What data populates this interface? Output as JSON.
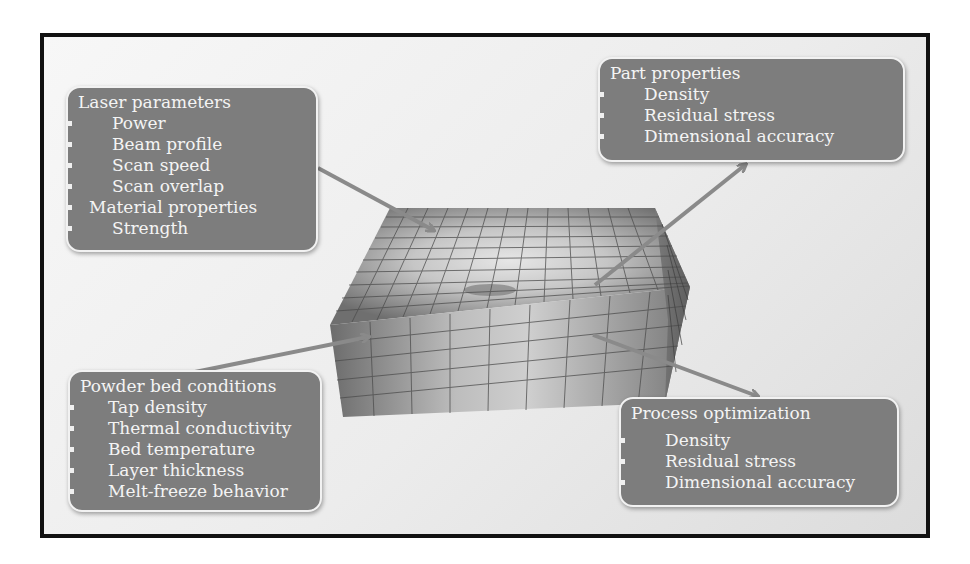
{
  "colors": {
    "frame_border": "#111111",
    "box_fill": "#7d7d7d",
    "box_border": "#f2f2f2",
    "box_text": "#f4f4f4",
    "arrow": "#8a8a8a",
    "block_dark": "#6e6e6e",
    "block_light": "#d8d8d8"
  },
  "boxes": {
    "laser": {
      "title": "Laser parameters",
      "items": [
        {
          "label": "Power",
          "level": 2
        },
        {
          "label": "Beam profile",
          "level": 2
        },
        {
          "label": "Scan speed",
          "level": 2
        },
        {
          "label": "Scan overlap",
          "level": 2
        },
        {
          "label": "Material properties",
          "level": 1
        },
        {
          "label": "Strength",
          "level": 2
        }
      ]
    },
    "part": {
      "title": "Part properties",
      "items": [
        {
          "label": "Density",
          "level": 2
        },
        {
          "label": "Residual stress",
          "level": 2
        },
        {
          "label": "Dimensional accuracy",
          "level": 2
        }
      ]
    },
    "powder": {
      "title": "Powder bed conditions",
      "items": [
        {
          "label": "Tap density",
          "level": 2
        },
        {
          "label": "Thermal conductivity",
          "level": 2
        },
        {
          "label": "Bed temperature",
          "level": 2
        },
        {
          "label": "Layer thickness",
          "level": 2
        },
        {
          "label": "Melt-freeze behavior",
          "level": 2
        }
      ]
    },
    "process": {
      "title": "Process optimization",
      "items": [
        {
          "label": "Density",
          "level": 2
        },
        {
          "label": "Residual stress",
          "level": 2
        },
        {
          "label": "Dimensional accuracy",
          "level": 2
        }
      ]
    }
  },
  "center": {
    "icon": "meshed-powder-bed-block-icon"
  }
}
